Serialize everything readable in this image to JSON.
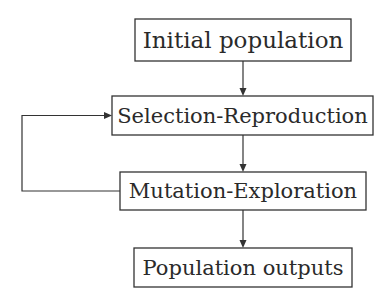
{
  "diagram": {
    "type": "flowchart",
    "nodes": [
      {
        "id": "initial",
        "label": "Initial population"
      },
      {
        "id": "selection",
        "label": "Selection-Reproduction"
      },
      {
        "id": "mutation",
        "label": "Mutation-Exploration"
      },
      {
        "id": "outputs",
        "label": "Population outputs"
      }
    ],
    "edges": [
      {
        "from": "initial",
        "to": "selection"
      },
      {
        "from": "selection",
        "to": "mutation"
      },
      {
        "from": "mutation",
        "to": "selection",
        "kind": "feedback-loop"
      },
      {
        "from": "mutation",
        "to": "outputs"
      }
    ],
    "colors": {
      "stroke": "#333333",
      "text": "#2a2a2a",
      "background": "#ffffff"
    }
  }
}
